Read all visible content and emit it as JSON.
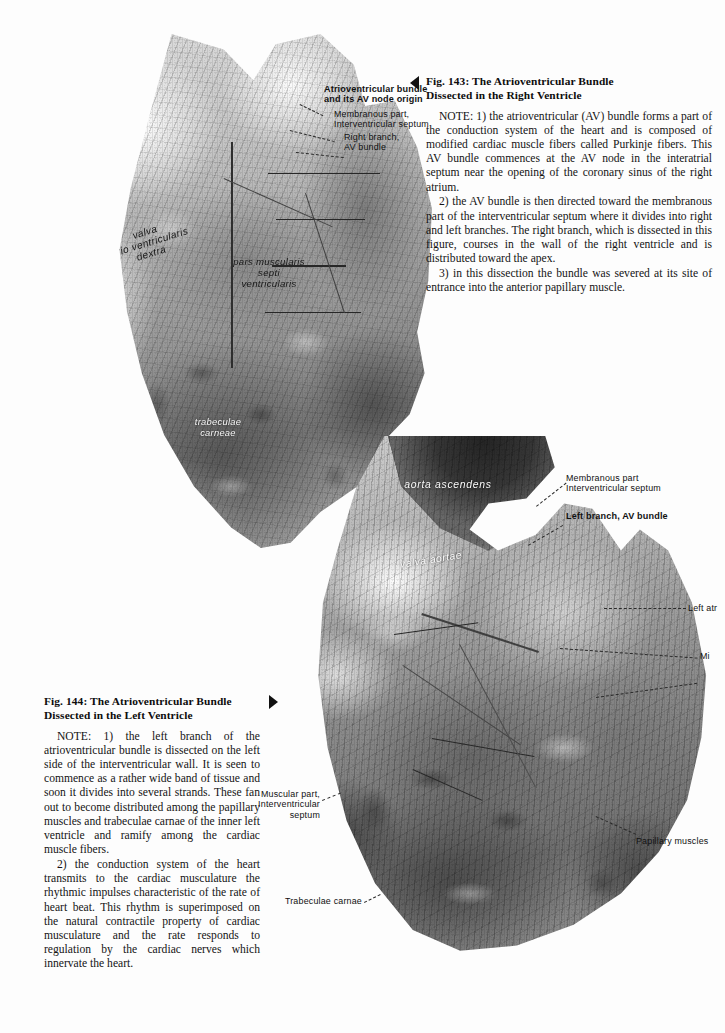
{
  "page": {
    "kind": "anatomy-atlas-page",
    "background_color": "#ffffff",
    "text_color": "#111111"
  },
  "figures": [
    {
      "id": "fig143",
      "caption_title": "Fig. 143:  The Atrioventricular Bundle\nDissected in the Right Ventricle",
      "marker_icon": "triangle-left-icon",
      "paragraphs": [
        "NOTE: 1) the atrioventricular (AV) bundle forms a part of the conduction system of the heart and is composed of modified cardiac muscle fibers called Purkinje fibers. This AV bundle commences at the AV node in the interatrial septum near the opening of the coronary sinus of the right atrium.",
        "2) the AV bundle is then directed toward the membranous part of the interventricular septum where it divides into right and left branches. The right branch, which is dissected in this figure, courses in the wall of the right ventricle and is distributed toward the apex.",
        "3) in this dissection the bundle was severed at its site of entrance into the anterior papillary muscle."
      ],
      "photo_caption_alt": "Grayscale photograph of a dissected human heart specimen showing the opened right ventricle with the atrioventricular bundle exposed",
      "overlay_labels": [
        {
          "text": "valva\natrio ventricularis\ndextra",
          "style": "dark-italic"
        },
        {
          "text": "pars muscularis\nsepti\nventricularis",
          "style": "dark-italic"
        },
        {
          "text": "trabeculae\ncarneae",
          "style": "light"
        }
      ],
      "leader_labels": [
        {
          "text": "Atrioventricular bundle\nand its AV node origin",
          "weight": "bold",
          "align": "left"
        },
        {
          "text": "Membranous part,\nInterventricular septum",
          "weight": "normal",
          "align": "left"
        },
        {
          "text": "Right branch,\nAV bundle",
          "weight": "normal",
          "align": "left"
        }
      ]
    },
    {
      "id": "fig144",
      "caption_title": "Fig. 144:  The Atrioventricular Bundle\nDissected in the Left Ventricle",
      "marker_icon": "triangle-right-icon",
      "paragraphs": [
        "NOTE: 1) the left branch of the atrioventricular bundle is dissected on the left side of the interventricular wall. It is seen to commence as a rather wide band of tissue and soon it divides into several strands. These fan out to become distributed among the papillary muscles and trabeculae carnae of the inner left ventricle and ramify among the cardiac muscle fibers.",
        "2) the conduction system of the heart transmits to the cardiac musculature the rhythmic impulses characteristic of the rate of heart beat. This rhythm is superimposed on the natural contractile property of cardiac musculature and the rate responds to regulation by the cardiac nerves which innervate the heart."
      ],
      "photo_caption_alt": "Grayscale photograph of a dissected human heart specimen showing the opened left ventricle with the left branch of the atrioventricular bundle fanning out",
      "overlay_labels": [
        {
          "text": "aorta ascendens",
          "style": "light"
        },
        {
          "text": "valva aortae",
          "style": "light"
        }
      ],
      "leader_labels": [
        {
          "text": "Membranous part\nInterventricular septum",
          "weight": "normal",
          "align": "left"
        },
        {
          "text": "Left branch, AV bundle",
          "weight": "bold",
          "align": "left"
        },
        {
          "text": "Left atr",
          "weight": "normal",
          "align": "left",
          "clipped": "true"
        },
        {
          "text": "Mi",
          "weight": "normal",
          "align": "left",
          "clipped": "true"
        },
        {
          "text": "Papillary muscles",
          "weight": "normal",
          "align": "left"
        },
        {
          "text": "Muscular part,\nInterventricular\nseptum",
          "weight": "normal",
          "align": "right"
        },
        {
          "text": "Trabeculae carnae",
          "weight": "normal",
          "align": "right"
        }
      ]
    }
  ]
}
